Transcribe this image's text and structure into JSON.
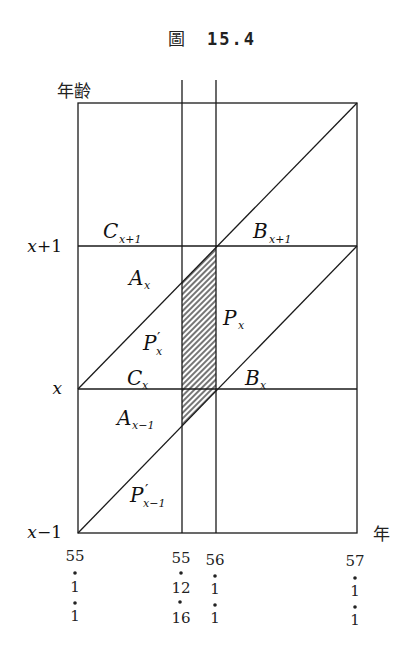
{
  "figure": {
    "title_prefix": "圖",
    "title_number": "15.4"
  },
  "axes": {
    "y_label": "年齢",
    "x_label": "年",
    "y_ticks": [
      {
        "var": "x",
        "offset": "+1"
      },
      {
        "var": "x",
        "offset": ""
      },
      {
        "var": "x",
        "offset": "−1"
      }
    ],
    "x_ticks": [
      {
        "year": "55",
        "month": "1",
        "day": "1"
      },
      {
        "year": "55",
        "month": "12",
        "day": "16"
      },
      {
        "year": "56",
        "month": "1",
        "day": "1"
      },
      {
        "year": "57",
        "month": "1",
        "day": "1"
      }
    ]
  },
  "regions": [
    {
      "letter": "C",
      "prime": "",
      "sub": "x+1"
    },
    {
      "letter": "B",
      "prime": "",
      "sub": "x+1"
    },
    {
      "letter": "A",
      "prime": "",
      "sub": "x"
    },
    {
      "letter": "P",
      "prime": "′",
      "sub": "x"
    },
    {
      "letter": "P",
      "prime": "",
      "sub": "x"
    },
    {
      "letter": "C",
      "prime": "",
      "sub": "x"
    },
    {
      "letter": "B",
      "prime": "",
      "sub": "x"
    },
    {
      "letter": "A",
      "prime": "",
      "sub": "x−1"
    },
    {
      "letter": "P",
      "prime": "′",
      "sub": "x−1"
    }
  ],
  "shaded_region": {
    "description": "hatched parallelogram between 55.12.16 and 56.1.1"
  }
}
